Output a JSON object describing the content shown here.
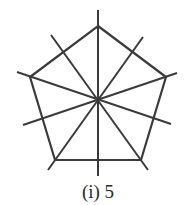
{
  "figure": {
    "caption": "(i) 5",
    "shape": "regular pentagon",
    "lines_of_symmetry": 5,
    "stroke_color": "#3a3a3a",
    "pentagon_vertices": [
      [
        98,
        26
      ],
      [
        166,
        77
      ],
      [
        141,
        160
      ],
      [
        55,
        160
      ],
      [
        30,
        77
      ]
    ],
    "symmetry_lines": [
      [
        [
          98,
          10
        ],
        [
          98,
          176
        ]
      ],
      [
        [
          17,
          72
        ],
        [
          171,
          124
        ]
      ],
      [
        [
          177,
          73
        ],
        [
          23,
          125
        ]
      ],
      [
        [
          48,
          170
        ],
        [
          143,
          37
        ]
      ],
      [
        [
          148,
          170
        ],
        [
          51,
          35
        ]
      ]
    ]
  }
}
